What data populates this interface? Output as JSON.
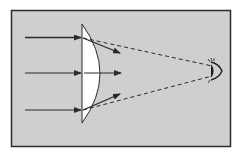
{
  "diagram": {
    "title": "",
    "colors": {
      "page": "#ffffff",
      "panel": "#cfcfcf",
      "border": "#2a2a2a",
      "lens": "#ffffff",
      "ray": "#2a2a2a"
    },
    "components": {
      "lens": {
        "type": "plano-convex lens",
        "label": ""
      },
      "incident_rays": {
        "count": 3,
        "label": ""
      },
      "refracted_rays": {
        "count": 3,
        "label": ""
      },
      "sight_lines": {
        "count": 2,
        "style": "dashed",
        "label": ""
      },
      "eye": {
        "icon": "eye-icon",
        "label": ""
      }
    }
  }
}
